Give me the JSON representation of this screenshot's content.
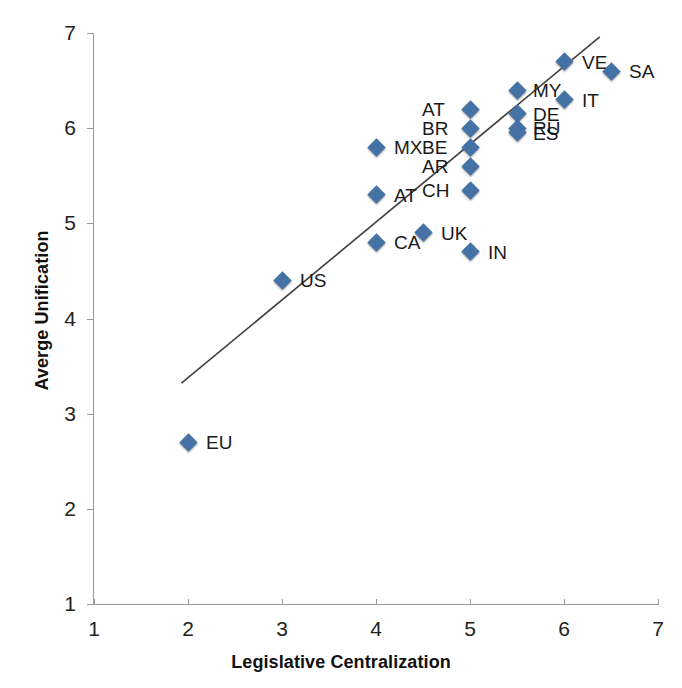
{
  "chart_data": {
    "type": "scatter",
    "title": "",
    "xlabel": "Legislative Centralization",
    "ylabel": "Averge Unification",
    "xlim": [
      1,
      7
    ],
    "ylim": [
      1,
      7
    ],
    "xticks": [
      "1",
      "2",
      "3",
      "4",
      "5",
      "6",
      "7"
    ],
    "yticks": [
      "1",
      "2",
      "3",
      "4",
      "5",
      "6",
      "7"
    ],
    "grid": false,
    "legend": null,
    "marker_color": "#4472a4",
    "trendline_color": "#404040",
    "trendline": {
      "x_start": 1.93,
      "y_start": 3.32,
      "x_end": 6.38,
      "y_end": 6.96
    },
    "points": [
      {
        "label": "EU",
        "x": 2.0,
        "y": 2.7,
        "label_dx": 18,
        "label_dy": -9
      },
      {
        "label": "US",
        "x": 3.0,
        "y": 4.4,
        "label_dx": 18,
        "label_dy": -9
      },
      {
        "label": "MX",
        "x": 4.0,
        "y": 5.8,
        "label_dx": 18,
        "label_dy": -9
      },
      {
        "label": "AT",
        "x": 4.0,
        "y": 5.3,
        "label_dx": 18,
        "label_dy": -9
      },
      {
        "label": "CA",
        "x": 4.0,
        "y": 4.8,
        "label_dx": 18,
        "label_dy": -9
      },
      {
        "label": "UK",
        "x": 4.5,
        "y": 4.9,
        "label_dx": 18,
        "label_dy": -9
      },
      {
        "label": "IN",
        "x": 5.0,
        "y": 4.7,
        "label_dx": 18,
        "label_dy": -9
      },
      {
        "label": "AT",
        "x": 5.0,
        "y": 6.2,
        "label_dx": -48,
        "label_dy": -9
      },
      {
        "label": "BR",
        "x": 5.0,
        "y": 6.0,
        "label_dx": -48,
        "label_dy": -9
      },
      {
        "label": "BE",
        "x": 5.0,
        "y": 5.8,
        "label_dx": -48,
        "label_dy": -9
      },
      {
        "label": "AR",
        "x": 5.0,
        "y": 5.6,
        "label_dx": -48,
        "label_dy": -9
      },
      {
        "label": "CH",
        "x": 5.0,
        "y": 5.35,
        "label_dx": -48,
        "label_dy": -9
      },
      {
        "label": "MY",
        "x": 5.5,
        "y": 6.4,
        "label_dx": 16,
        "label_dy": -9
      },
      {
        "label": "DE",
        "x": 5.5,
        "y": 6.15,
        "label_dx": 16,
        "label_dy": -9
      },
      {
        "label": "RU",
        "x": 5.5,
        "y": 6.0,
        "label_dx": 16,
        "label_dy": -9
      },
      {
        "label": "ES",
        "x": 5.5,
        "y": 5.95,
        "label_dx": 16,
        "label_dy": -9
      },
      {
        "label": "IT",
        "x": 6.0,
        "y": 6.3,
        "label_dx": 18,
        "label_dy": -9
      },
      {
        "label": "VE",
        "x": 6.0,
        "y": 6.7,
        "label_dx": 18,
        "label_dy": -9
      },
      {
        "label": "SA",
        "x": 6.5,
        "y": 6.6,
        "label_dx": 18,
        "label_dy": -9
      }
    ]
  }
}
